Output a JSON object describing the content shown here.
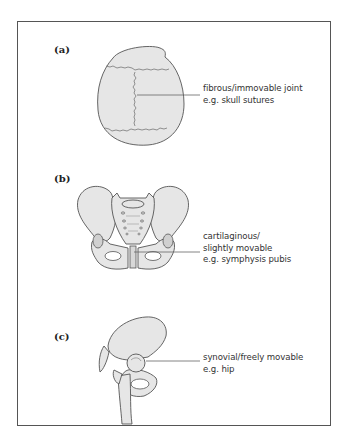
{
  "figure": {
    "panels": [
      {
        "label": "(a)",
        "illustration": "skull-top-view",
        "caption_lines": [
          "fibrous/immovable joint",
          "e.g. skull sutures"
        ]
      },
      {
        "label": "(b)",
        "illustration": "pelvis-front-view",
        "caption_lines": [
          "cartilaginous/",
          "slightly movable",
          "e.g. symphysis pubis"
        ]
      },
      {
        "label": "(c)",
        "illustration": "hip-joint",
        "caption_lines": [
          "synovial/freely movable",
          "e.g. hip"
        ]
      }
    ],
    "colors": {
      "bone_fill": "#e6e6e6",
      "outline": "#555555",
      "frame": "#555555",
      "leader_line": "#666666",
      "text": "#333333"
    }
  }
}
